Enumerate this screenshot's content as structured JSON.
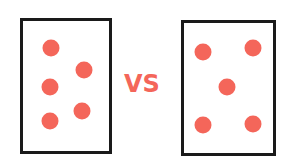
{
  "comparison": {
    "label": "VS",
    "accent_color": "#f4665a",
    "left_card": {
      "dots": 5,
      "pattern": "two-column staggered"
    },
    "right_card": {
      "dots": 5,
      "pattern": "quincunx (dice five)"
    }
  }
}
